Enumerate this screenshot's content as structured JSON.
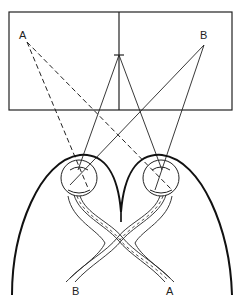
{
  "diagram": {
    "labels": {
      "field_left_point": "A",
      "field_right_point": "B",
      "nerve_left_end": "B",
      "nerve_right_end": "A"
    },
    "colors": {
      "line": "#222222",
      "background": "#ffffff"
    }
  }
}
